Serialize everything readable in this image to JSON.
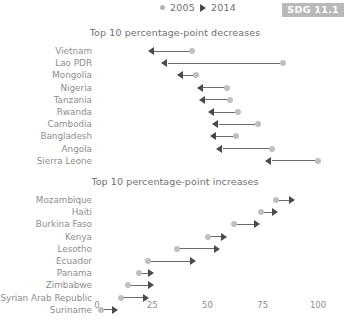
{
  "legend": {
    "series_2005": "2005",
    "series_2014": "2014",
    "marker_2005": "circle-marker",
    "marker_2014": "triangle-marker",
    "color_2005": "#c0c0c0",
    "color_2014": "#4a4a4a"
  },
  "badge": {
    "label": "SDG 11.1",
    "color": "#b9b9b9"
  },
  "panels": {
    "decreases_title": "Top 10 percentage-point decreases",
    "increases_title": "Top 10 percentage-point increases"
  },
  "axis": {
    "ticks": [
      "0",
      "25",
      "50",
      "75",
      "100"
    ],
    "min": 0,
    "max": 100
  },
  "chart_data": [
    {
      "type": "scatter",
      "title": "Top 10 percentage-point decreases",
      "xlabel": "",
      "ylabel": "",
      "xlim": [
        0,
        100
      ],
      "grid": false,
      "legend": [
        "2005",
        "2014"
      ],
      "legend_position": "top",
      "categories": [
        "Vietnam",
        "Lao PDR",
        "Mongolia",
        "Nigeria",
        "Tanzania",
        "Rwanda",
        "Cambodia",
        "Bangladesh",
        "Angola",
        "Sierra Leone"
      ],
      "series": [
        {
          "name": "2005",
          "values": [
            43,
            84,
            45,
            59,
            60,
            64,
            73,
            63,
            79,
            100
          ]
        },
        {
          "name": "2014",
          "values": [
            26,
            32,
            39,
            48,
            49,
            53,
            55,
            54,
            57,
            79
          ]
        }
      ]
    },
    {
      "type": "scatter",
      "title": "Top 10 percentage-point increases",
      "xlabel": "",
      "ylabel": "",
      "xlim": [
        0,
        100
      ],
      "grid": false,
      "legend": [
        "2005",
        "2014"
      ],
      "legend_position": "top",
      "categories": [
        "Mozambique",
        "Haiti",
        "Burkina Faso",
        "Kenya",
        "Lesotho",
        "Ecuador",
        "Panama",
        "Zimbabwe",
        "Syrian Arab Republic",
        "Suriname"
      ],
      "series": [
        {
          "name": "2005",
          "values": [
            81,
            74,
            62,
            50,
            36,
            23,
            19,
            14,
            11,
            2
          ]
        },
        {
          "name": "2014",
          "values": [
            87,
            79,
            71,
            56,
            53,
            42,
            23,
            23,
            21,
            7
          ]
        }
      ]
    }
  ]
}
